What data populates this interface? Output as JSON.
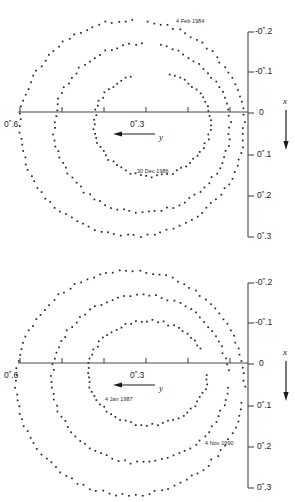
{
  "figure": {
    "title": "",
    "panels": [
      {
        "id": "top",
        "x_axis": {
          "name": "y",
          "arrow_direction": "left",
          "tick_labels": [
            {
              "text_pre": "0",
              "text_sec": "″",
              "text_post": ".6",
              "value": 0.6,
              "px": 20
            },
            {
              "text_pre": "0",
              "text_sec": "″",
              "text_post": ".3",
              "value": 0.3,
              "px": 146
            }
          ],
          "tick_px": [
            20,
            62,
            104,
            146,
            188,
            230
          ],
          "axis_y_px": 112,
          "axis_x0_px": 18,
          "axis_x1_px": 248
        },
        "y_axis": {
          "name": "x",
          "arrow_direction": "down",
          "tick_labels": [
            {
              "text": "-0″.2",
              "sign": "-",
              "num_pre": "0",
              "num_post": ".2",
              "value": -0.2,
              "px": 32
            },
            {
              "text": "-0″.1",
              "sign": "-",
              "num_pre": "0",
              "num_post": ".1",
              "value": -0.1,
              "px": 72
            },
            {
              "text": "0",
              "sign": "",
              "num_pre": "0",
              "num_post": "",
              "value": 0.0,
              "px": 113
            },
            {
              "text": "0″.1",
              "sign": "",
              "num_pre": "0",
              "num_post": ".1",
              "value": 0.1,
              "px": 155
            },
            {
              "text": "0″.2",
              "sign": "",
              "num_pre": "0",
              "num_post": ".2",
              "value": 0.2,
              "px": 196
            },
            {
              "text": "0″.3",
              "sign": "",
              "num_pre": "0",
              "num_post": ".3",
              "value": 0.3,
              "px": 237
            }
          ],
          "spine_x_px": 248,
          "spine_top_px": 32,
          "spine_bottom_px": 237
        },
        "annotations": [
          {
            "name": "date-start",
            "text": "4 Feb 1984",
            "x_px": 176,
            "y_px": 18
          },
          {
            "name": "date-end",
            "text": "30 Dec 1986",
            "x_px": 137,
            "y_px": 168
          }
        ]
      },
      {
        "id": "bottom",
        "x_axis": {
          "name": "y",
          "arrow_direction": "left",
          "tick_labels": [
            {
              "text_pre": "0",
              "text_sec": "″",
              "text_post": ".6",
              "value": 0.6,
              "px": 20
            },
            {
              "text_pre": "0",
              "text_sec": "″",
              "text_post": ".3",
              "value": 0.3,
              "px": 146
            }
          ],
          "tick_px": [
            20,
            62,
            104,
            146,
            188,
            230
          ],
          "axis_y_px": 112,
          "axis_x0_px": 18,
          "axis_x1_px": 248
        },
        "y_axis": {
          "name": "x",
          "arrow_direction": "down",
          "tick_labels": [
            {
              "text": "-0″.2",
              "sign": "-",
              "num_pre": "0",
              "num_post": ".2",
              "value": -0.2,
              "px": 32
            },
            {
              "text": "-0″.1",
              "sign": "-",
              "num_pre": "0",
              "num_post": ".1",
              "value": -0.1,
              "px": 72
            },
            {
              "text": "0",
              "sign": "",
              "num_pre": "0",
              "num_post": "",
              "value": 0.0,
              "px": 113
            },
            {
              "text": "0″.1",
              "sign": "",
              "num_pre": "0",
              "num_post": ".1",
              "value": 0.1,
              "px": 155
            },
            {
              "text": "0″.2",
              "sign": "",
              "num_pre": "0",
              "num_post": ".2",
              "value": 0.2,
              "px": 196
            },
            {
              "text": "0″.3",
              "sign": "",
              "num_pre": "0",
              "num_post": ".3",
              "value": 0.3,
              "px": 237
            }
          ],
          "spine_x_px": 248,
          "spine_top_px": 32,
          "spine_bottom_px": 237
        },
        "annotations": [
          {
            "name": "date-start",
            "text": "4 Jan 1987",
            "x_px": 105,
            "y_px": 145
          },
          {
            "name": "date-end",
            "text": "4 Nov 1990",
            "x_px": 205,
            "y_px": 189
          }
        ]
      }
    ],
    "style": {
      "dot_color": "#222222",
      "axis_color": "#4a4a4a",
      "background": "#ffffff",
      "dot_size_px": 1.7
    }
  },
  "chart_data": {
    "type": "scatter",
    "title": "",
    "xlabel": "y",
    "ylabel": "x",
    "xlim": [
      0.65,
      0.105
    ],
    "ylim": [
      -0.235,
      0.33
    ],
    "grid": false,
    "legend": "none",
    "note": "Two panels of apparent relative orbit tracks plotted as dotted spiral loops; coordinates in arcseconds. Panel 1 spans 4 Feb 1984 to 30 Dec 1986, panel 2 spans 4 Jan 1987 to 4 Nov 1990.",
    "panels": [
      {
        "name": "top",
        "date_start": "4 Feb 1984",
        "date_end": "30 Dec 1986",
        "series": [
          {
            "name": "outer-loop",
            "center_x_px": 132,
            "center_y_px": 128,
            "rx_px": 112,
            "ry_px": 108,
            "start_deg": -82,
            "sweep_deg": 352,
            "n_points": 104
          },
          {
            "name": "middle-loop",
            "center_x_px": 142,
            "center_y_px": 128,
            "rx_px": 88,
            "ry_px": 84,
            "start_deg": -78,
            "sweep_deg": 348,
            "n_points": 86
          },
          {
            "name": "inner-loop",
            "center_x_px": 152,
            "center_y_px": 124,
            "rx_px": 58,
            "ry_px": 52,
            "start_deg": -72,
            "sweep_deg": 320,
            "n_points": 62
          }
        ]
      },
      {
        "name": "bottom",
        "date_start": "4 Jan 1987",
        "date_end": "4 Nov 1990",
        "series": [
          {
            "name": "outer-loop",
            "center_x_px": 130,
            "center_y_px": 132,
            "rx_px": 114,
            "ry_px": 112,
            "start_deg": 10,
            "sweep_deg": 352,
            "n_points": 106
          },
          {
            "name": "middle-loop",
            "center_x_px": 140,
            "center_y_px": 128,
            "rx_px": 88,
            "ry_px": 84,
            "start_deg": 6,
            "sweep_deg": 348,
            "n_points": 86
          },
          {
            "name": "inner-loop",
            "center_x_px": 148,
            "center_y_px": 122,
            "rx_px": 60,
            "ry_px": 52,
            "start_deg": 2,
            "sweep_deg": 330,
            "n_points": 64
          }
        ]
      }
    ]
  }
}
